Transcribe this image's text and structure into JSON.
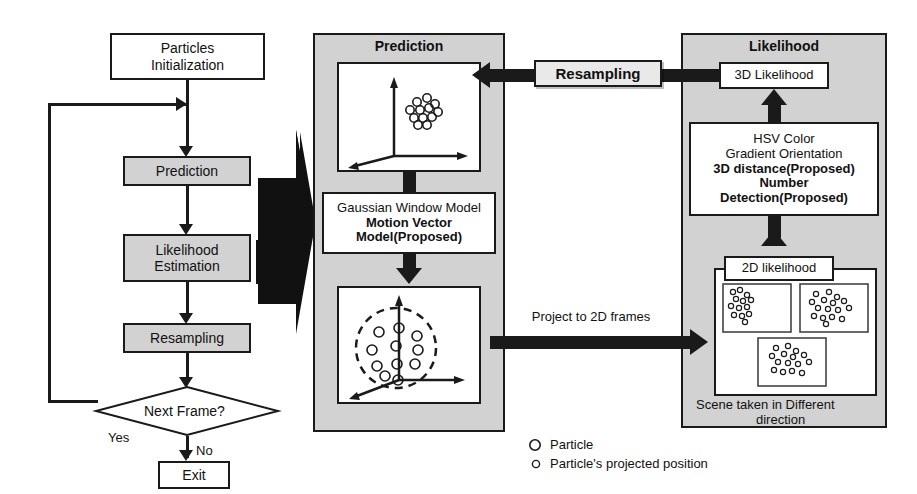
{
  "diagram": {
    "colors": {
      "panel_fill": "#d2d2d2",
      "box_fill_gray": "#d2d2d2",
      "box_fill_white": "#ffffff",
      "stroke": "#1a1a1a",
      "background": "#ffffff"
    }
  },
  "flowchart": {
    "nodes": [
      {
        "id": "particles-initialization",
        "label": "Particles\nInitialization",
        "line1": "Particles",
        "line2": "Initialization",
        "shape": "rect",
        "fill": "white"
      },
      {
        "id": "prediction",
        "label": "Prediction",
        "shape": "rect",
        "fill": "gray"
      },
      {
        "id": "likelihood-estimation",
        "label": "Likelihood\nEstimation",
        "line1": "Likelihood",
        "line2": "Estimation",
        "shape": "rect",
        "fill": "gray"
      },
      {
        "id": "resampling",
        "label": "Resampling",
        "shape": "rect",
        "fill": "gray"
      },
      {
        "id": "next-frame",
        "label": "Next Frame?",
        "shape": "diamond",
        "fill": "white"
      },
      {
        "id": "exit",
        "label": "Exit",
        "shape": "rect",
        "fill": "white"
      }
    ],
    "edge_labels": {
      "yes": "Yes",
      "no": "No"
    }
  },
  "prediction_panel": {
    "title": "Prediction",
    "top_plot": {
      "name": "3d-axes-particles-before",
      "axes": [
        "x",
        "y",
        "z"
      ],
      "particle_count": 12,
      "marker": "open-circle"
    },
    "model_box": {
      "line1": "Gaussian Window Model",
      "line2": "Motion Vector",
      "line3": "Model(Proposed)",
      "bold_lines": [
        2,
        3
      ]
    },
    "bottom_plot": {
      "name": "3d-axes-particles-after",
      "axes": [
        "x",
        "y",
        "z"
      ],
      "particle_count": 11,
      "marker": "open-circle",
      "annotation": "dashed-circle"
    }
  },
  "likelihood_panel": {
    "title": "Likelihood",
    "likelihood_3d_box": {
      "label": "3D Likelihood"
    },
    "features_box": {
      "line1": "HSV Color",
      "line2": "Gradient Orientation",
      "line3": "3D distance(Proposed)",
      "line4": "Number",
      "line5": "Detection(Proposed)",
      "bold_lines": [
        3,
        4,
        5
      ]
    },
    "likelihood_2d": {
      "label": "2D likelihood",
      "caption_line1": "Scene taken in Different",
      "caption_line2": "direction",
      "views": [
        {
          "name": "view-top-left",
          "projected_particle_count": 13
        },
        {
          "name": "view-top-right",
          "projected_particle_count": 16
        },
        {
          "name": "view-bottom",
          "projected_particle_count": 15
        }
      ]
    }
  },
  "connectors": {
    "resampling_arrow_label": "Resampling",
    "project_arrow_label": "Project to 2D frames"
  },
  "legend": {
    "items": [
      {
        "marker": "large-open-circle",
        "label": "Particle"
      },
      {
        "marker": "small-open-circle",
        "label": "Particle's projected position"
      }
    ]
  }
}
